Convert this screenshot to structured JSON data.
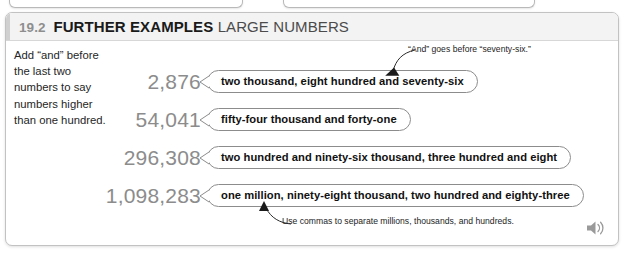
{
  "page": {
    "section_number": "19.2",
    "title_strong": "FURTHER EXAMPLES",
    "title_light": "LARGE NUMBERS"
  },
  "instruction": {
    "text": "Add “and” before the last two numbers to say numbers higher than one hundred."
  },
  "examples": [
    {
      "number": "2,876",
      "words": "two thousand, eight hundred and seventy-six"
    },
    {
      "number": "54,041",
      "words": "fifty-four thousand and forty-one"
    },
    {
      "number": "296,308",
      "words": "two hundred and ninety-six thousand, three hundred and eight"
    },
    {
      "number": "1,098,283",
      "words": "one million, ninety-eight thousand, two hundred and eighty-three"
    }
  ],
  "annotations": {
    "top": "“And” goes before “seventy-six.”",
    "bottom": "Use commas to separate millions, thousands, and hundreds."
  },
  "icons": {
    "audio": "speaker-icon"
  },
  "colors": {
    "number_gray": "#8c8c8c",
    "header_bg": "#f3f3f3",
    "bubble_border": "#8c8c8c",
    "panel_border": "#c2c2c2",
    "text_dark": "#111111"
  }
}
